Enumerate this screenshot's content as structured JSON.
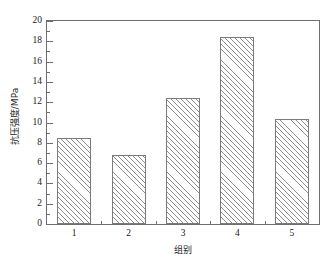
{
  "chart_data": {
    "type": "bar",
    "title": "",
    "subtitle": "",
    "categories": [
      "1",
      "2",
      "3",
      "4",
      "5"
    ],
    "values": [
      8.5,
      6.8,
      12.4,
      18.4,
      10.3
    ],
    "xlabel": "组别",
    "ylabel": "抗压强度/MPa",
    "ylim": [
      0,
      20
    ],
    "ytick_step": 2,
    "yticks": [
      "0",
      "2",
      "4",
      "6",
      "8",
      "10",
      "12",
      "14",
      "16",
      "18",
      "20"
    ],
    "xticks": [
      "1",
      "2",
      "3",
      "4",
      "5"
    ],
    "grid": false,
    "legend": null,
    "legend_position": "none",
    "bar_fill": "diagonal-hatch",
    "bar_edge_color": "#7a7a7a",
    "hatch_color": "#8d8d8d",
    "axis_color": "#6e6e6e",
    "background_color": "#ffffff",
    "minor_ticks": true,
    "tick_direction": "in"
  }
}
